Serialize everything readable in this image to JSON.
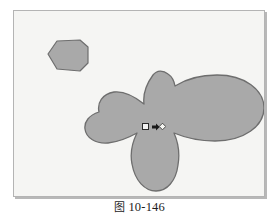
{
  "figure": {
    "caption_cjk": "图",
    "caption_number": "10-146",
    "caption_full": "图 10-146",
    "plate_background_color": "#f5f5f3",
    "plate_border_color": "#b4b4b4",
    "shape_fill_color": "#a9a9a9",
    "shape_outline_color": "#6e6e6e",
    "page_background_color": "#ffffff"
  },
  "shapes": {
    "hexagon": {
      "name": "hexagonal-profile",
      "fill": "#a9a9a9",
      "stroke": "#6e6e6e",
      "points": "34,43 43,30 66,29 74,36 74,52 66,60 43,58"
    },
    "flower_blob": {
      "name": "flower-blob-profile",
      "fill": "#a9a9a9",
      "stroke": "#6e6e6e",
      "path": "M 139 64 C 131 75 129 85 130 93 C 120 85 109 80 100 81 C 88 83 83 92 85 101 C 75 104 70 111 71 118 C 72 127 82 133 94 132 C 104 131 114 127 123 122 C 118 132 116 143 118 153 C 121 170 131 180 142 180 C 153 180 162 170 164 154 C 166 142 164 131 160 122 C 172 127 186 130 201 130 C 230 130 250 115 250 97 C 250 79 231 64 203 64 C 187 64 172 68 161 75 C 160 69 157 65 154 63 C 149 59 143 59 139 64 Z"
    },
    "selection_marker": {
      "name": "selection-cursor-marker",
      "square_label": "selection-square",
      "arrow_label": "direction-arrow",
      "handle_label": "grip-handle"
    }
  }
}
